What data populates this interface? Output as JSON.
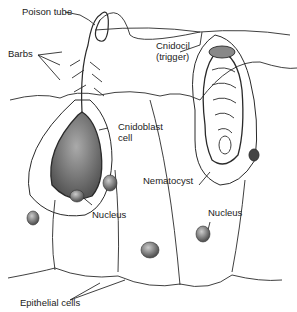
{
  "diagram": {
    "labels": {
      "poison_tube": "Poison tube",
      "barbs": "Barbs",
      "cnidocil_line1": "Cnidocil",
      "cnidocil_line2": "(trigger)",
      "cnidoblast_line1": "Cnidoblast",
      "cnidoblast_line2": "cell",
      "nematocyst": "Nematocyst",
      "nucleus_left": "Nucleus",
      "nucleus_right": "Nucleus",
      "epithelial": "Epithelial cells"
    },
    "colors": {
      "ink": "#2a2a2a",
      "stipple": "#8a8a8a",
      "dark_fill": "#555555"
    }
  }
}
